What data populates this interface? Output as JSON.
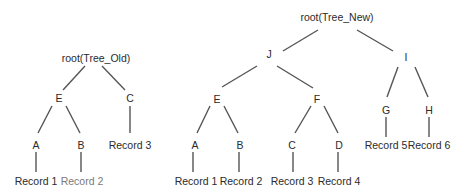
{
  "diagram": {
    "type": "tree-comparison",
    "trees": [
      {
        "name": "Tree_Old",
        "root_label": "root(Tree_Old)",
        "nodes": [
          {
            "id": "root_old",
            "label": "root(Tree_Old)",
            "x": 96,
            "y": 58
          },
          {
            "id": "E_old",
            "label": "E",
            "x": 59,
            "y": 98
          },
          {
            "id": "C_old",
            "label": "C",
            "x": 130,
            "y": 98
          },
          {
            "id": "A_old",
            "label": "A",
            "x": 36,
            "y": 145
          },
          {
            "id": "B_old",
            "label": "B",
            "x": 81,
            "y": 145
          },
          {
            "id": "R3_old",
            "label": "Record 3",
            "x": 130,
            "y": 145
          },
          {
            "id": "R1_old",
            "label": "Record 1",
            "x": 36,
            "y": 181
          },
          {
            "id": "R2_old",
            "label": "Record 2",
            "x": 82,
            "y": 181,
            "style": "faded"
          }
        ],
        "edges": [
          {
            "x1": 85,
            "y1": 66,
            "x2": 63,
            "y2": 90
          },
          {
            "x1": 102,
            "y1": 66,
            "x2": 125,
            "y2": 90
          },
          {
            "x1": 52,
            "y1": 106,
            "x2": 38,
            "y2": 133
          },
          {
            "x1": 66,
            "y1": 106,
            "x2": 80,
            "y2": 133
          },
          {
            "x1": 130,
            "y1": 106,
            "x2": 130,
            "y2": 133
          },
          {
            "x1": 36,
            "y1": 152,
            "x2": 36,
            "y2": 172
          },
          {
            "x1": 81,
            "y1": 152,
            "x2": 81,
            "y2": 172
          }
        ]
      },
      {
        "name": "Tree_New",
        "root_label": "root(Tree_New)",
        "nodes": [
          {
            "id": "root_new",
            "label": "root(Tree_New)",
            "x": 337,
            "y": 17
          },
          {
            "id": "J",
            "label": "J",
            "x": 269,
            "y": 54
          },
          {
            "id": "I",
            "label": "I",
            "x": 406,
            "y": 57
          },
          {
            "id": "E_new",
            "label": "E",
            "x": 217,
            "y": 99
          },
          {
            "id": "F",
            "label": "F",
            "x": 317,
            "y": 99
          },
          {
            "id": "G",
            "label": "G",
            "x": 386,
            "y": 110
          },
          {
            "id": "H",
            "label": "H",
            "x": 429,
            "y": 110
          },
          {
            "id": "A_new",
            "label": "A",
            "x": 195,
            "y": 145
          },
          {
            "id": "B_new",
            "label": "B",
            "x": 240,
            "y": 145
          },
          {
            "id": "C_new",
            "label": "C",
            "x": 292,
            "y": 145
          },
          {
            "id": "D",
            "label": "D",
            "x": 339,
            "y": 145
          },
          {
            "id": "R5",
            "label": "Record 5",
            "x": 386,
            "y": 145
          },
          {
            "id": "R6",
            "label": "Record 6",
            "x": 429,
            "y": 145
          },
          {
            "id": "R1_new",
            "label": "Record 1",
            "x": 196,
            "y": 181
          },
          {
            "id": "R2_new",
            "label": "Record 2",
            "x": 241,
            "y": 181
          },
          {
            "id": "R3_new",
            "label": "Record 3",
            "x": 292,
            "y": 181
          },
          {
            "id": "R4",
            "label": "Record 4",
            "x": 339,
            "y": 181
          }
        ],
        "edges": [
          {
            "x1": 318,
            "y1": 30,
            "x2": 283,
            "y2": 51
          },
          {
            "x1": 357,
            "y1": 30,
            "x2": 393,
            "y2": 51
          },
          {
            "x1": 257,
            "y1": 66,
            "x2": 222,
            "y2": 87
          },
          {
            "x1": 277,
            "y1": 66,
            "x2": 313,
            "y2": 88
          },
          {
            "x1": 398,
            "y1": 67,
            "x2": 387,
            "y2": 97
          },
          {
            "x1": 415,
            "y1": 67,
            "x2": 428,
            "y2": 97
          },
          {
            "x1": 210,
            "y1": 106,
            "x2": 197,
            "y2": 133
          },
          {
            "x1": 224,
            "y1": 106,
            "x2": 238,
            "y2": 133
          },
          {
            "x1": 311,
            "y1": 106,
            "x2": 295,
            "y2": 133
          },
          {
            "x1": 324,
            "y1": 106,
            "x2": 338,
            "y2": 133
          },
          {
            "x1": 386,
            "y1": 117,
            "x2": 386,
            "y2": 137
          },
          {
            "x1": 429,
            "y1": 117,
            "x2": 429,
            "y2": 137
          },
          {
            "x1": 193,
            "y1": 152,
            "x2": 193,
            "y2": 172
          },
          {
            "x1": 239,
            "y1": 152,
            "x2": 239,
            "y2": 172
          },
          {
            "x1": 293,
            "y1": 152,
            "x2": 293,
            "y2": 172
          },
          {
            "x1": 338,
            "y1": 152,
            "x2": 338,
            "y2": 172
          }
        ]
      }
    ]
  }
}
